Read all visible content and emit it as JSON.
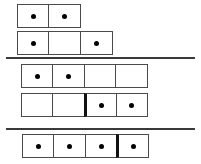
{
  "figure": {
    "background_color": "#ffffff",
    "cell_border_color": "#4a4a4a",
    "segment_divider_color": "#111111",
    "pip_color": "#000000",
    "separator_color": "#3a3a3a",
    "cell_width": 33,
    "cell_height": 24,
    "groups": [
      {
        "name": "group-1",
        "top": 4,
        "rows": [
          {
            "name": "row-1",
            "left": 17,
            "top": 4,
            "cells": [
              {
                "filled": true,
                "segment_start": false
              },
              {
                "filled": true,
                "segment_start": false
              }
            ]
          },
          {
            "name": "row-2",
            "left": 17,
            "top": 31,
            "cells": [
              {
                "filled": true,
                "segment_start": false
              },
              {
                "filled": false,
                "segment_start": false
              },
              {
                "filled": true,
                "segment_start": false
              }
            ]
          }
        ]
      },
      {
        "name": "group-2",
        "top": 64,
        "rows": [
          {
            "name": "row-3",
            "left": 21,
            "top": 64,
            "cells": [
              {
                "filled": true,
                "segment_start": false
              },
              {
                "filled": true,
                "segment_start": false
              },
              {
                "filled": false,
                "segment_start": false
              },
              {
                "filled": false,
                "segment_start": false
              }
            ]
          },
          {
            "name": "row-4",
            "left": 21,
            "top": 93,
            "cells": [
              {
                "filled": false,
                "segment_start": false
              },
              {
                "filled": false,
                "segment_start": false
              },
              {
                "filled": true,
                "segment_start": true
              },
              {
                "filled": true,
                "segment_start": false
              }
            ]
          }
        ]
      },
      {
        "name": "group-3",
        "top": 134,
        "rows": [
          {
            "name": "row-5",
            "left": 22,
            "top": 134,
            "cells": [
              {
                "filled": true,
                "segment_start": false
              },
              {
                "filled": true,
                "segment_start": false
              },
              {
                "filled": true,
                "segment_start": false
              },
              {
                "filled": true,
                "segment_start": true
              }
            ]
          }
        ]
      }
    ],
    "separators": [
      {
        "name": "separator-1",
        "left": 6,
        "top": 57,
        "width": 189
      },
      {
        "name": "separator-2",
        "left": 6,
        "top": 128,
        "width": 189
      }
    ]
  }
}
